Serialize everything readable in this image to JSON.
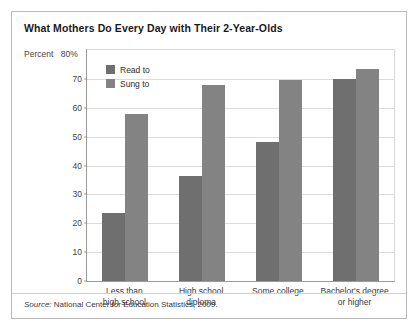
{
  "figure": {
    "title": "What Mothers Do Every Day with Their 2-Year-Olds",
    "percent_label": "Percent",
    "axis_top_label": "80%",
    "source_prefix": "Source:",
    "source_text": " National Center for Education Statistics, 2009."
  },
  "chart_data": {
    "type": "bar",
    "title": "What Mothers Do Every Day with Their 2-Year-Olds",
    "xlabel": "",
    "ylabel": "Percent",
    "ylim": [
      0,
      80
    ],
    "yticks": [
      0,
      10,
      20,
      30,
      40,
      50,
      60,
      70,
      80
    ],
    "ytick_labels": [
      "0",
      "10",
      "20",
      "30",
      "40",
      "50",
      "60",
      "70",
      "80%"
    ],
    "grid": true,
    "legend_position": "upper-left-inside",
    "categories": [
      "Less than\nhigh school",
      "High school\ndiploma",
      "Some college",
      "Bachelor's degree\nor higher"
    ],
    "series": [
      {
        "name": "Read to",
        "color": "#6f6f6f",
        "values": [
          23.5,
          36.5,
          48,
          70
        ]
      },
      {
        "name": "Sung to",
        "color": "#838383",
        "values": [
          58,
          68,
          69.5,
          73.5
        ]
      }
    ]
  }
}
